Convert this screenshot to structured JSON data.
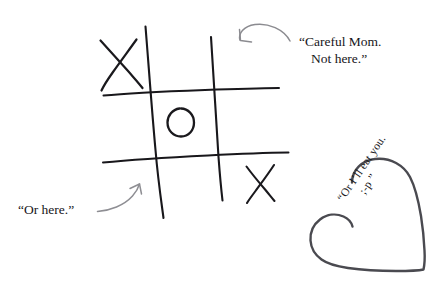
{
  "scene": {
    "title": "tic-tac-toe doodle with handwritten notes",
    "background_color": "#ffffff",
    "width": 439,
    "height": 288
  },
  "notes": {
    "careful": {
      "line1": "“Careful Mom.",
      "line2": "Not here.”",
      "color": "#17161a"
    },
    "or_here": {
      "text": "“Or here.”",
      "color": "#17161a"
    },
    "heart": {
      "line1": "“Or I’ll eat you.",
      "line2": ";-p ”",
      "color": "#1a1a1d",
      "rotation_deg": -56
    }
  },
  "board": {
    "type": "tic-tac-toe",
    "line_color": "#18171b",
    "cells": [
      {
        "position": "top-left",
        "mark": "X"
      },
      {
        "position": "top-center",
        "mark": ""
      },
      {
        "position": "top-right",
        "mark": ""
      },
      {
        "position": "middle-left",
        "mark": ""
      },
      {
        "position": "middle-center",
        "mark": "O"
      },
      {
        "position": "middle-right",
        "mark": ""
      },
      {
        "position": "bottom-left",
        "mark": ""
      },
      {
        "position": "bottom-center",
        "mark": ""
      },
      {
        "position": "bottom-right",
        "mark": "X"
      }
    ]
  },
  "arrows": [
    {
      "name": "arrow-to-top-right-cell",
      "color": "#8b8b90",
      "points_to": "top-right"
    },
    {
      "name": "arrow-to-bottom-left-cell",
      "color": "#8e8e93",
      "points_to": "bottom-left"
    }
  ],
  "heart": {
    "outline_color": "#4a4a50",
    "fill": "#ffffff"
  }
}
